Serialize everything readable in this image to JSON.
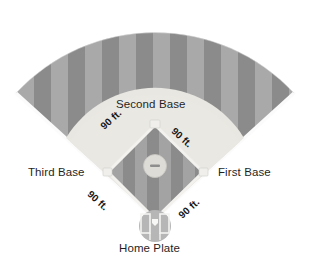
{
  "diagram": {
    "labels": {
      "second_base": "Second Base",
      "third_base": "Third Base",
      "first_base": "First Base",
      "home_plate": "Home Plate"
    },
    "distances": {
      "home_to_first": "90 ft.",
      "first_to_second": "90 ft.",
      "second_to_third": "90 ft.",
      "third_to_home": "90 ft."
    },
    "colors": {
      "background": "#ffffff",
      "grass_dark": "#8b8b8b",
      "grass_light": "#a9a9a9",
      "infield_dirt": "#e9e7e1",
      "foul_line": "#fbfbfb",
      "baseline": "#f2f1ee",
      "mound": "#dedcd6",
      "rubber": "#8e8e8e",
      "home_circle": "#b6b6b6",
      "plate_white": "#f4f4f2",
      "text": "#1f1f1f"
    },
    "elements": {
      "outfield": "outfield-grass-fan",
      "mow_stripes": "mowing-stripe-pattern",
      "infield_arc": "infield-dirt-arc",
      "inner_diamond": "inner-diamond-grass",
      "pitchers_mound": "pitchers-mound",
      "pitching_rubber": "pitching-rubber",
      "home_plate_circle": "home-plate-dirt-circle",
      "batters_boxes": "batters-boxes",
      "foul_lines": "foul-lines"
    }
  }
}
